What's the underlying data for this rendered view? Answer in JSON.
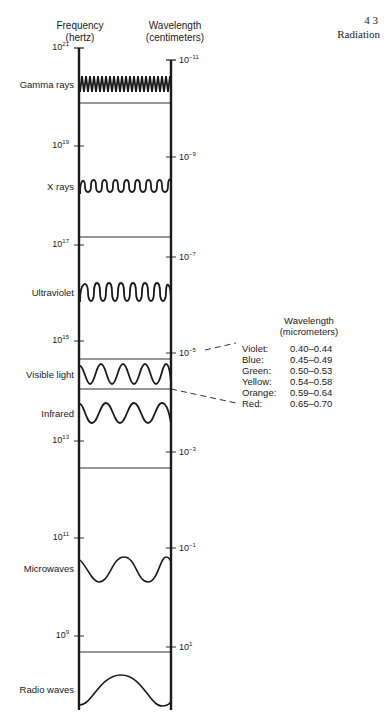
{
  "page": {
    "number": "4 3",
    "section": "Radiation"
  },
  "axes": {
    "left": {
      "title_line1": "Frequency",
      "title_line2": "(hertz)"
    },
    "right": {
      "title_line1": "Wavelength",
      "title_line2": "(centimeters)"
    }
  },
  "left_ticks": [
    {
      "base": "10",
      "exp": "21",
      "y": 48
    },
    {
      "base": "10",
      "exp": "19",
      "y": 146
    },
    {
      "base": "10",
      "exp": "17",
      "y": 245
    },
    {
      "base": "10",
      "exp": "15",
      "y": 341
    },
    {
      "base": "10",
      "exp": "13",
      "y": 441
    },
    {
      "base": "10",
      "exp": "11",
      "y": 538
    },
    {
      "base": "10",
      "exp": "9",
      "y": 636
    }
  ],
  "right_ticks": [
    {
      "base": "10",
      "exp": "−11",
      "y": 60
    },
    {
      "base": "10",
      "exp": "−9",
      "y": 157
    },
    {
      "base": "10",
      "exp": "−7",
      "y": 257
    },
    {
      "base": "10",
      "exp": "−5",
      "y": 353
    },
    {
      "base": "10",
      "exp": "−3",
      "y": 452
    },
    {
      "base": "10",
      "exp": "−1",
      "y": 548
    },
    {
      "base": "10",
      "exp": "1",
      "y": 647
    }
  ],
  "bands": [
    {
      "label": "Gamma rays",
      "y": 85
    },
    {
      "label": "X rays",
      "y": 187
    },
    {
      "label": "Ultraviolet",
      "y": 293
    },
    {
      "label": "Visible light",
      "y": 375
    },
    {
      "label": "Infrared",
      "y": 414
    },
    {
      "label": "Microwaves",
      "y": 569
    },
    {
      "label": "Radio waves",
      "y": 690
    }
  ],
  "visible_legend": {
    "title_line1": "Wavelength",
    "title_line2": "(micrometers)",
    "rows": [
      {
        "color": "Violet:",
        "range": "0.40–0.44"
      },
      {
        "color": "Blue:",
        "range": "0.45–0.49"
      },
      {
        "color": "Green:",
        "range": "0.50–0.53"
      },
      {
        "color": "Yellow:",
        "range": "0.54–0.58"
      },
      {
        "color": "Orange:",
        "range": "0.59–0.64"
      },
      {
        "color": "Red:",
        "range": "0.65–0.70"
      }
    ]
  },
  "colors": {
    "ink": "#1a1a1a",
    "background": "#ffffff"
  }
}
